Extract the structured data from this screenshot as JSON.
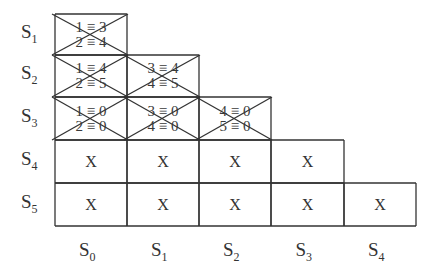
{
  "diagram": {
    "row_labels": [
      {
        "base": "S",
        "sub": "1"
      },
      {
        "base": "S",
        "sub": "2"
      },
      {
        "base": "S",
        "sub": "3"
      },
      {
        "base": "S",
        "sub": "4"
      },
      {
        "base": "S",
        "sub": "5"
      }
    ],
    "col_labels": [
      {
        "base": "S",
        "sub": "0"
      },
      {
        "base": "S",
        "sub": "1"
      },
      {
        "base": "S",
        "sub": "2"
      },
      {
        "base": "S",
        "sub": "3"
      },
      {
        "base": "S",
        "sub": "4"
      }
    ],
    "cells": [
      {
        "row": 0,
        "col": 0,
        "type": "crossed",
        "lines": [
          "1 ≡ 3",
          "2 ≡ 4"
        ]
      },
      {
        "row": 1,
        "col": 0,
        "type": "crossed",
        "lines": [
          "1 ≡ 4",
          "2 ≡ 5"
        ]
      },
      {
        "row": 1,
        "col": 1,
        "type": "crossed",
        "lines": [
          "3 ≡ 4",
          "4 ≡ 5"
        ]
      },
      {
        "row": 2,
        "col": 0,
        "type": "crossed",
        "lines": [
          "1 ≡ 0",
          "2 ≡ 0"
        ]
      },
      {
        "row": 2,
        "col": 1,
        "type": "crossed",
        "lines": [
          "3 ≡ 0",
          "4 ≡ 0"
        ]
      },
      {
        "row": 2,
        "col": 2,
        "type": "crossed",
        "lines": [
          "4 ≡ 0",
          "5 ≡ 0"
        ]
      },
      {
        "row": 3,
        "col": 0,
        "type": "mark",
        "text": "X"
      },
      {
        "row": 3,
        "col": 1,
        "type": "mark",
        "text": "X"
      },
      {
        "row": 3,
        "col": 2,
        "type": "mark",
        "text": "X"
      },
      {
        "row": 3,
        "col": 3,
        "type": "mark",
        "text": "X"
      },
      {
        "row": 4,
        "col": 0,
        "type": "mark",
        "text": "X"
      },
      {
        "row": 4,
        "col": 1,
        "type": "mark",
        "text": "X"
      },
      {
        "row": 4,
        "col": 2,
        "type": "mark",
        "text": "X"
      },
      {
        "row": 4,
        "col": 3,
        "type": "mark",
        "text": "X"
      },
      {
        "row": 4,
        "col": 4,
        "type": "mark",
        "text": "X"
      }
    ],
    "line_color": "#333333"
  }
}
